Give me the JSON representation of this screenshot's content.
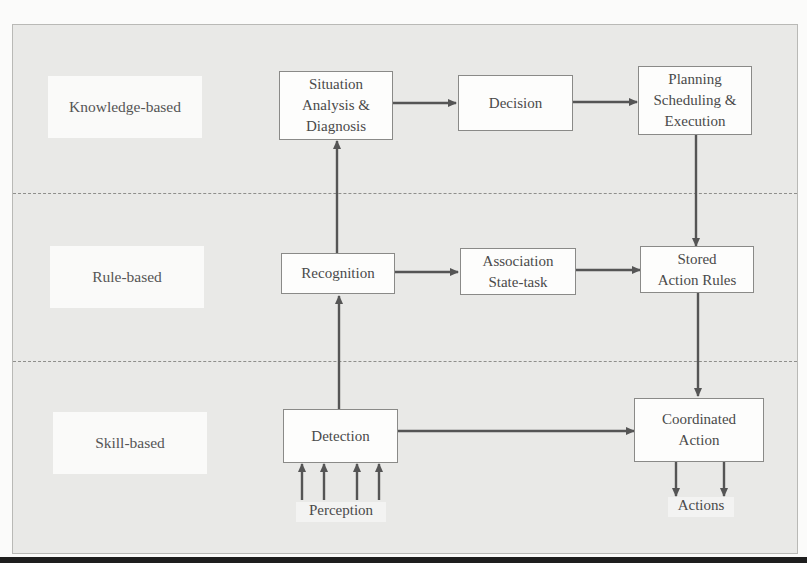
{
  "diagram": {
    "levels": [
      {
        "id": "knowledge",
        "label": "Knowledge-based"
      },
      {
        "id": "rule",
        "label": "Rule-based"
      },
      {
        "id": "skill",
        "label": "Skill-based"
      }
    ],
    "nodes": {
      "situation_analysis": {
        "lines": [
          "Situation",
          "Analysis &",
          "Diagnosis"
        ],
        "level": "knowledge"
      },
      "decision": {
        "lines": [
          "Decision"
        ],
        "level": "knowledge"
      },
      "planning": {
        "lines": [
          "Planning",
          "Scheduling &",
          "Execution"
        ],
        "level": "knowledge"
      },
      "recognition": {
        "lines": [
          "Recognition"
        ],
        "level": "rule"
      },
      "association": {
        "lines": [
          "Association",
          "State-task"
        ],
        "level": "rule"
      },
      "stored_rules": {
        "lines": [
          "Stored",
          "Action Rules"
        ],
        "level": "rule"
      },
      "detection": {
        "lines": [
          "Detection"
        ],
        "level": "skill"
      },
      "coordinated_action": {
        "lines": [
          "Coordinated",
          "Action"
        ],
        "level": "skill"
      }
    },
    "inputs_label": "Perception",
    "outputs_label": "Actions",
    "edges": [
      {
        "from": "situation_analysis",
        "to": "decision"
      },
      {
        "from": "decision",
        "to": "planning"
      },
      {
        "from": "planning",
        "to": "stored_rules"
      },
      {
        "from": "recognition",
        "to": "situation_analysis"
      },
      {
        "from": "recognition",
        "to": "association"
      },
      {
        "from": "association",
        "to": "stored_rules"
      },
      {
        "from": "stored_rules",
        "to": "coordinated_action"
      },
      {
        "from": "detection",
        "to": "recognition"
      },
      {
        "from": "detection",
        "to": "coordinated_action"
      },
      {
        "from": "Perception",
        "to": "detection",
        "count": 4
      },
      {
        "from": "coordinated_action",
        "to": "Actions",
        "count": 2
      }
    ],
    "colors": {
      "background": "#e9e9e7",
      "box_fill": "#fdfdfc",
      "arrow": "#555555",
      "divider": "#8f8f8c"
    }
  }
}
